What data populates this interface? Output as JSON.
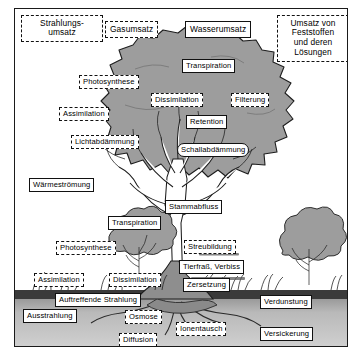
{
  "figure": {
    "title_legend": [
      {
        "id": "strahlungsumsatz",
        "label": "Strahlungs-\numsatz",
        "border": "dashed"
      },
      {
        "id": "gasumsatz",
        "label": "Gasumsatz",
        "border": "dashed"
      },
      {
        "id": "wasserumsatz",
        "label": "Wasserumsatz",
        "border": "solid"
      },
      {
        "id": "feststoffumsatz",
        "label": "Umsatz von\nFeststoffen\nund deren\nLösungen",
        "border": "dashed"
      }
    ],
    "canopy_labels": [
      {
        "id": "transpiration-krone",
        "label": "Transpiration",
        "border": "solid"
      },
      {
        "id": "photosynthese-krone",
        "label": "Photosynthese",
        "border": "dashed"
      },
      {
        "id": "dissimilation-krone",
        "label": "Dissimilation",
        "border": "dashed"
      },
      {
        "id": "filterung",
        "label": "Filterung",
        "border": "dashed"
      },
      {
        "id": "assimilation-krone",
        "label": "Assimilation",
        "border": "dashed"
      },
      {
        "id": "retention",
        "label": "Retention",
        "border": "solid"
      },
      {
        "id": "lichtabdaemmung",
        "label": "Lichtabdämmung",
        "border": "dashed"
      },
      {
        "id": "schallabdaemmung",
        "label": "Schallabdämmung",
        "border": "rounded"
      }
    ],
    "trunk_labels": [
      {
        "id": "waermestroemung",
        "label": "Wärmeströmung",
        "border": "solid"
      },
      {
        "id": "stammabfluss",
        "label": "Stammabfluss",
        "border": "solid"
      },
      {
        "id": "transpiration-stamm",
        "label": "Transpiration",
        "border": "solid"
      }
    ],
    "ground_labels": [
      {
        "id": "photosynthese-boden",
        "label": "Photosynthese",
        "border": "dashed"
      },
      {
        "id": "streubildung",
        "label": "Streubildung",
        "border": "dashed"
      },
      {
        "id": "tierfrass-verbiss",
        "label": "Tierfraß, Verbiss",
        "border": "solid"
      },
      {
        "id": "assimilation-boden",
        "label": "Assimilation",
        "border": "dashed"
      },
      {
        "id": "dissimilation-boden",
        "label": "Dissimilation",
        "border": "dashed"
      },
      {
        "id": "zersetzung",
        "label": "Zersetzung",
        "border": "solid"
      },
      {
        "id": "auftreffende-strahlung",
        "label": "Auftreffende Strahlung",
        "border": "solid"
      },
      {
        "id": "verdunstung",
        "label": "Verdunstung",
        "border": "solid"
      }
    ],
    "soil_labels": [
      {
        "id": "ausstrahlung",
        "label": "Ausstrahlung",
        "border": "solid"
      },
      {
        "id": "osmose",
        "label": "Osmose",
        "border": "dashed"
      },
      {
        "id": "ionentausch",
        "label": "Ionentausch",
        "border": "dashed"
      },
      {
        "id": "diffusion",
        "label": "Diffusion",
        "border": "dashed"
      },
      {
        "id": "versickerung",
        "label": "Versickerung",
        "border": "solid"
      }
    ],
    "colors": {
      "frame": "#1a1a1a",
      "canopy_fill": "#9d9d9d",
      "trunk_fill": "#8e8e8e",
      "soil_dark": "#3d3d3d",
      "soil_light": "#cfcfcf",
      "label_bg": "#ffffff",
      "ink": "#000000"
    }
  }
}
